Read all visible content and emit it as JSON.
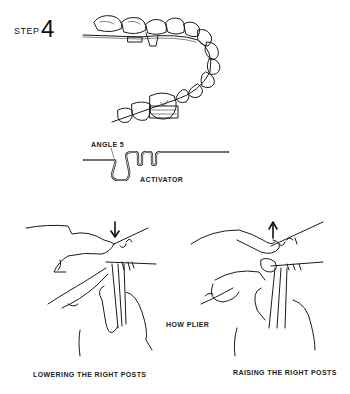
{
  "step": {
    "label": "STEP",
    "number": "4"
  },
  "figures": {
    "dental_arch": {
      "description": "Dental arch with archwire and brackets on molars",
      "icon": "dental-arch-illustration"
    },
    "wire_detail": {
      "labels": {
        "angle": "ANGLE 5",
        "activator": "ACTIVATOR"
      },
      "icon": "archwire-loop-illustration"
    },
    "plier_usage": {
      "center_label": "HOW PLIER",
      "panels": [
        {
          "caption": "LOWERING THE RIGHT POSTS",
          "arrow_direction": "down",
          "icon": "hands-plier-lowering-illustration"
        },
        {
          "caption": "RAISING THE RIGHT POSTS",
          "arrow_direction": "up",
          "icon": "hands-plier-raising-illustration"
        }
      ]
    }
  }
}
